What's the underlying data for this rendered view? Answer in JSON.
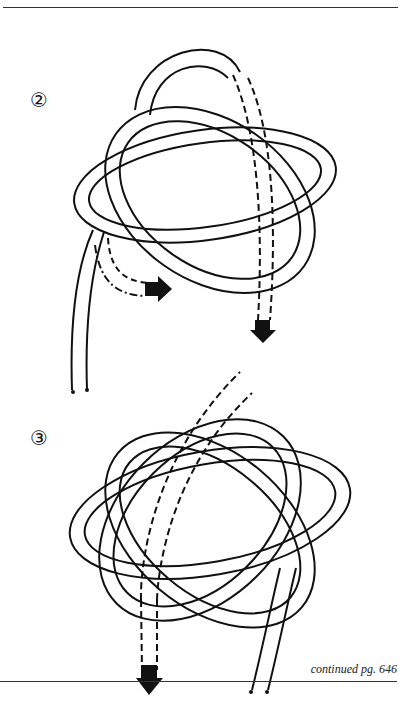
{
  "page": {
    "steps": [
      {
        "number": "②",
        "description": "knot diagram step 2 with directional arrows"
      },
      {
        "number": "③",
        "description": "knot diagram step 3 completed rosette with arrow"
      }
    ],
    "continued_note": "continued pg. 646"
  }
}
